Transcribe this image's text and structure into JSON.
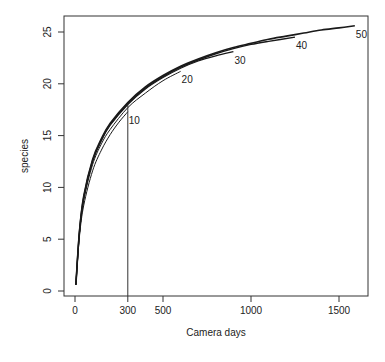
{
  "chart_data": {
    "type": "line",
    "title": "",
    "xlabel": "Camera days",
    "ylabel": "species",
    "xlim": [
      -90,
      1650
    ],
    "ylim": [
      -0.5,
      26.2
    ],
    "x_ticks": [
      0,
      300,
      500,
      1000,
      1500
    ],
    "x_tick_labels": [
      "0",
      "300",
      "500",
      "1000",
      "1500"
    ],
    "y_ticks": [
      0,
      5,
      10,
      15,
      20,
      25
    ],
    "y_tick_labels": [
      "0",
      "5",
      "10",
      "15",
      "20",
      "25"
    ],
    "grid": false,
    "legend": "none (curves labeled inline at their endpoints)",
    "reference_line": {
      "orientation": "vertical",
      "x": 300,
      "y_from": -0.5,
      "y_to": 18.0
    },
    "series": [
      {
        "name": "10",
        "label": "10",
        "x": [
          5,
          25,
          50,
          100,
          150,
          200,
          250,
          300
        ],
        "y": [
          0.6,
          5.2,
          8.3,
          11.6,
          13.6,
          15.1,
          16.3,
          17.3
        ]
      },
      {
        "name": "20",
        "label": "20",
        "x": [
          5,
          25,
          50,
          100,
          150,
          200,
          300,
          400,
          500,
          600
        ],
        "y": [
          0.6,
          5.5,
          8.8,
          12.2,
          14.2,
          15.6,
          17.7,
          19.1,
          20.3,
          21.2
        ]
      },
      {
        "name": "30",
        "label": "30",
        "x": [
          5,
          25,
          50,
          100,
          150,
          200,
          300,
          400,
          500,
          600,
          700,
          800,
          900
        ],
        "y": [
          0.6,
          5.6,
          9.0,
          12.5,
          14.5,
          16.0,
          18.0,
          19.5,
          20.6,
          21.5,
          22.2,
          22.7,
          23.1
        ]
      },
      {
        "name": "40",
        "label": "40",
        "x": [
          5,
          25,
          50,
          100,
          150,
          200,
          300,
          400,
          500,
          600,
          700,
          800,
          900,
          1000,
          1100,
          1250
        ],
        "y": [
          0.6,
          5.7,
          9.1,
          12.6,
          14.6,
          16.1,
          18.1,
          19.6,
          20.7,
          21.6,
          22.3,
          22.9,
          23.4,
          23.8,
          24.1,
          24.5
        ]
      },
      {
        "name": "50",
        "label": "50",
        "x": [
          5,
          25,
          50,
          100,
          150,
          200,
          300,
          400,
          500,
          600,
          700,
          800,
          900,
          1000,
          1100,
          1200,
          1300,
          1400,
          1500,
          1590
        ],
        "y": [
          0.6,
          5.7,
          9.2,
          12.7,
          14.7,
          16.2,
          18.2,
          19.7,
          20.8,
          21.7,
          22.4,
          23.0,
          23.5,
          23.9,
          24.3,
          24.6,
          24.9,
          25.2,
          25.4,
          25.6
        ]
      }
    ]
  },
  "colors": {
    "line": "#1a1a1a",
    "frame": "#333333",
    "background": "#ffffff"
  }
}
